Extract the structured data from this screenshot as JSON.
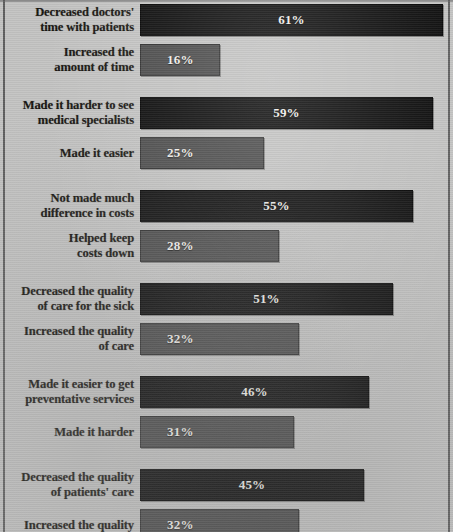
{
  "chart_data": {
    "type": "bar",
    "title": "",
    "xlabel": "",
    "ylabel": "",
    "orientation": "horizontal",
    "xlim": [
      0,
      61
    ],
    "grid": false,
    "legend": null,
    "value_suffix": "%",
    "categories": [
      "Decreased doctors'\ntime with patients",
      "Increased the\namount of time",
      "Made it harder to see\nmedical specialists",
      "Made it easier",
      "Not made much\ndifference in costs",
      "Helped keep\ncosts down",
      "Decreased the quality\nof care  for the sick",
      "Increased the quality\nof care",
      "Made it easier to get\npreventative services",
      "Made it harder",
      "Decreased the quality\nof patients' care",
      "Increased the quality"
    ],
    "values": [
      61,
      16,
      59,
      25,
      55,
      28,
      51,
      32,
      46,
      31,
      45,
      32
    ],
    "colors": {
      "primary_bar": "#0b0b0b",
      "secondary_bar": "#4a4a4a",
      "background": "#c3c3c2",
      "label_text": "#16130f",
      "value_text": "#f2f0ec"
    },
    "groups": [
      {
        "rows": [
          {
            "label": "Decreased doctors'\ntime with patients",
            "value": 61,
            "value_label": "61%",
            "style": "primary"
          },
          {
            "label": "Increased the\namount of time",
            "value": 16,
            "value_label": "16%",
            "style": "secondary"
          }
        ]
      },
      {
        "rows": [
          {
            "label": "Made it harder to see\nmedical specialists",
            "value": 59,
            "value_label": "59%",
            "style": "primary"
          },
          {
            "label": "Made it easier",
            "value": 25,
            "value_label": "25%",
            "style": "secondary"
          }
        ]
      },
      {
        "rows": [
          {
            "label": "Not made much\ndifference in costs",
            "value": 55,
            "value_label": "55%",
            "style": "primary"
          },
          {
            "label": "Helped keep\ncosts down",
            "value": 28,
            "value_label": "28%",
            "style": "secondary"
          }
        ]
      },
      {
        "rows": [
          {
            "label": "Decreased the quality\nof care  for the sick",
            "value": 51,
            "value_label": "51%",
            "style": "primary"
          },
          {
            "label": "Increased the quality\nof care",
            "value": 32,
            "value_label": "32%",
            "style": "secondary"
          }
        ]
      },
      {
        "rows": [
          {
            "label": "Made it easier to get\npreventative services",
            "value": 46,
            "value_label": "46%",
            "style": "primary"
          },
          {
            "label": "Made it harder",
            "value": 31,
            "value_label": "31%",
            "style": "secondary"
          }
        ]
      },
      {
        "rows": [
          {
            "label": "Decreased the quality\nof patients' care",
            "value": 45,
            "value_label": "45%",
            "style": "primary"
          },
          {
            "label": "Increased the quality",
            "value": 32,
            "value_label": "32%",
            "style": "secondary"
          }
        ]
      }
    ]
  },
  "layout": {
    "bar_left_px": 140,
    "px_per_percent": 4.97,
    "bar_height_px": 32,
    "row_gap_px": 8,
    "group_gap_px": 13,
    "first_row_top_px": 4
  }
}
